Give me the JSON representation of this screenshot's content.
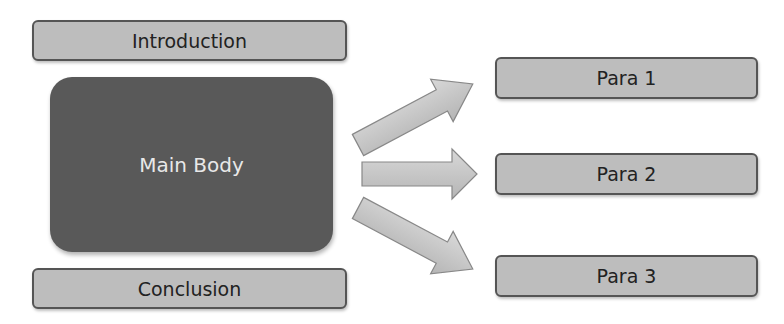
{
  "diagram": {
    "type": "essay-structure",
    "left_column": {
      "introduction": "Introduction",
      "main_body": "Main Body",
      "conclusion": "Conclusion"
    },
    "paragraphs": [
      {
        "label": "Para 1"
      },
      {
        "label": "Para 2"
      },
      {
        "label": "Para 3"
      }
    ],
    "arrows": [
      {
        "from": "Main Body",
        "to": "Para 1",
        "direction": "up-right"
      },
      {
        "from": "Main Body",
        "to": "Para 2",
        "direction": "right"
      },
      {
        "from": "Main Body",
        "to": "Para 3",
        "direction": "down-right"
      }
    ],
    "colors": {
      "box_fill": "#bdbdbd",
      "box_border": "#555555",
      "main_fill": "#595959",
      "main_text": "#e8e8e8",
      "arrow_fill": "#c8c8c8"
    }
  }
}
